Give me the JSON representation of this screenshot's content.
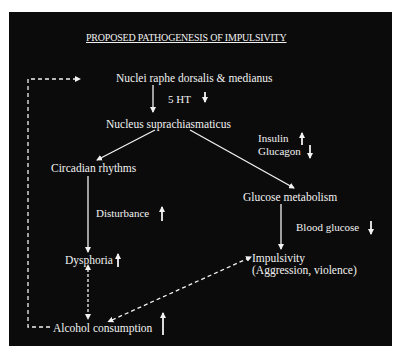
{
  "title": "PROPOSED PATHOGENESIS OF IMPULSIVITY",
  "colors": {
    "background": "#0b0b0b",
    "foreground": "#f2f2f2",
    "page": "#ffffff"
  },
  "nodes": {
    "raphe": "Nuclei raphe dorsalis  & medianus",
    "serotonin": "5 HT",
    "scn": "Nucleus suprachiasmaticus",
    "insulin": "Insulin",
    "glucagon": "Glucagon",
    "circadian": "Circadian rhythms",
    "glucose_metabolism": "Glucose metabolism",
    "disturbance": "Disturbance",
    "blood_glucose": "Blood glucose",
    "dysphoria": "Dysphoria",
    "impulsivity": "Impulsivity",
    "impulsivity_detail": "(Aggression, violence)",
    "alcohol": "Alcohol consumption"
  },
  "indicators": {
    "serotonin": "down",
    "insulin": "up",
    "glucagon": "down",
    "disturbance": "up",
    "blood_glucose": "down",
    "dysphoria": "up",
    "alcohol": "up"
  },
  "edges": [
    {
      "from": "raphe",
      "to": "scn",
      "style": "solid"
    },
    {
      "from": "scn",
      "to": "circadian",
      "style": "solid"
    },
    {
      "from": "scn",
      "to": "glucose_metabolism",
      "style": "solid"
    },
    {
      "from": "circadian",
      "to": "dysphoria",
      "style": "solid"
    },
    {
      "from": "glucose_metabolism",
      "to": "impulsivity",
      "style": "solid"
    },
    {
      "from": "dysphoria",
      "to": "alcohol",
      "style": "dashed",
      "bidirectional": true
    },
    {
      "from": "alcohol",
      "to": "impulsivity",
      "style": "dashed",
      "bidirectional": true
    },
    {
      "from": "alcohol",
      "to": "raphe",
      "style": "dashed",
      "feedback": true
    }
  ]
}
